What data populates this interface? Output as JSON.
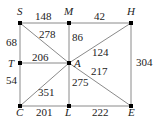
{
  "graph": {
    "nodes": [
      {
        "id": "S",
        "label": "S",
        "x": 20,
        "y": 23
      },
      {
        "id": "M",
        "label": "M",
        "x": 69,
        "y": 23
      },
      {
        "id": "H",
        "label": "H",
        "x": 131,
        "y": 23
      },
      {
        "id": "T",
        "label": "T",
        "x": 20,
        "y": 63
      },
      {
        "id": "A",
        "label": "A",
        "x": 69,
        "y": 63
      },
      {
        "id": "C",
        "label": "C",
        "x": 20,
        "y": 106
      },
      {
        "id": "L",
        "label": "L",
        "x": 69,
        "y": 106
      },
      {
        "id": "E",
        "label": "E",
        "x": 131,
        "y": 106
      }
    ],
    "edges": [
      {
        "from": "S",
        "to": "M",
        "weight": "148"
      },
      {
        "from": "M",
        "to": "H",
        "weight": "42"
      },
      {
        "from": "S",
        "to": "T",
        "weight": "68"
      },
      {
        "from": "S",
        "to": "A",
        "weight": "278"
      },
      {
        "from": "M",
        "to": "A",
        "weight": "86"
      },
      {
        "from": "H",
        "to": "A",
        "weight": "124"
      },
      {
        "from": "H",
        "to": "E",
        "weight": "304"
      },
      {
        "from": "T",
        "to": "A",
        "weight": "206"
      },
      {
        "from": "T",
        "to": "C",
        "weight": "54"
      },
      {
        "from": "C",
        "to": "A",
        "weight": "351"
      },
      {
        "from": "A",
        "to": "L",
        "weight": "275"
      },
      {
        "from": "A",
        "to": "E",
        "weight": "217"
      },
      {
        "from": "C",
        "to": "L",
        "weight": "201"
      },
      {
        "from": "L",
        "to": "E",
        "weight": "222"
      }
    ]
  },
  "colors": {
    "edge": "#8a8a8a",
    "node": "#000000",
    "text": "#222222"
  }
}
